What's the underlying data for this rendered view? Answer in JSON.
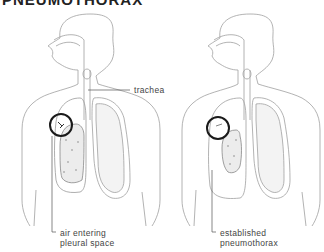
{
  "title": "PNEUMOTHORAX",
  "figures": [
    {
      "id": "left",
      "callouts": {
        "trachea": "trachea",
        "air_line1": "air entering",
        "air_line2": "pleural space"
      }
    },
    {
      "id": "right",
      "callouts": {
        "est_line1": "established",
        "est_line2": "pneumothorax"
      }
    }
  ],
  "colors": {
    "outline": "#9a9a9a",
    "circle": "#1a1a1a",
    "text": "#444444",
    "background": "#ffffff"
  }
}
